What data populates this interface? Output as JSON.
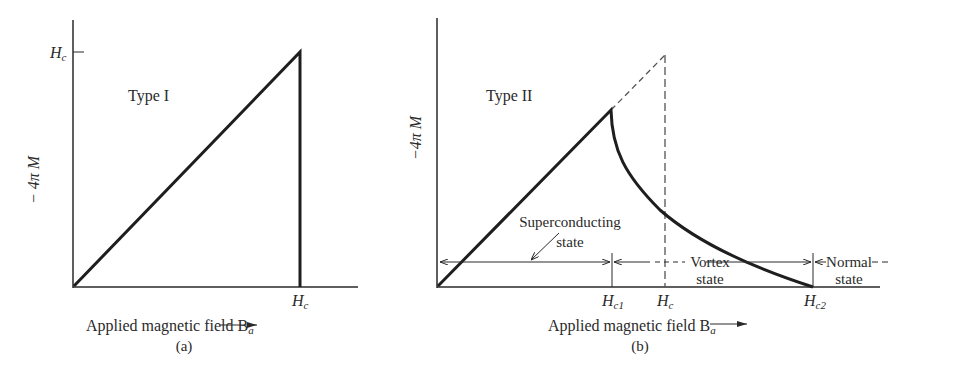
{
  "panel_a": {
    "title": "Type I",
    "ylabel": "− 4π M",
    "y_tick": "H",
    "y_tick_sub": "c",
    "x_tick": "H",
    "x_tick_sub": "c",
    "xlabel": "Applied magnetic field B",
    "xlabel_sub": "a",
    "caption": "(a)"
  },
  "panel_b": {
    "title": "Type II",
    "ylabel": "−4π M",
    "x_ticks": [
      {
        "main": "H",
        "sub": "c1"
      },
      {
        "main": "H",
        "sub": "c"
      },
      {
        "main": "H",
        "sub": "c2"
      }
    ],
    "regions": {
      "superconducting_line1": "Superconducting",
      "superconducting_line2": "state",
      "vortex_line1": "Vortex",
      "vortex_line2": "state",
      "normal_line1": "Normal",
      "normal_line2": "state"
    },
    "xlabel": "Applied magnetic field B",
    "xlabel_sub": "a",
    "caption": "(b)"
  },
  "colors": {
    "ink": "#2a2a2a",
    "background": "#ffffff"
  }
}
